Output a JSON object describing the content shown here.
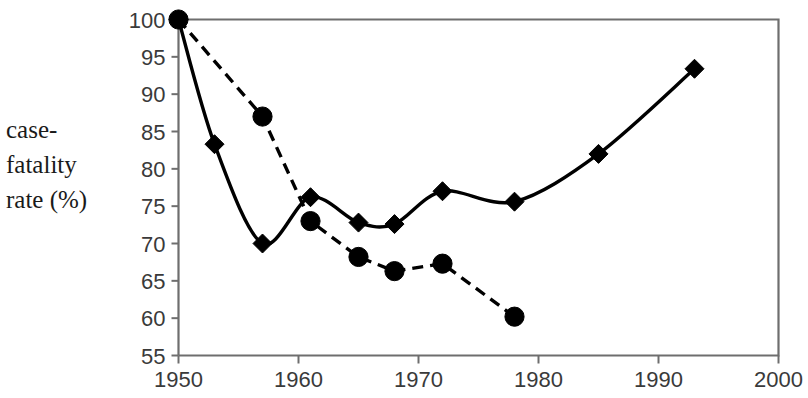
{
  "chart_data": {
    "type": "line",
    "title": "",
    "subtitle": "",
    "xlabel": "",
    "ylabel": "case-fatality rate (%)",
    "ylabel_lines": [
      "case-",
      "fatality",
      "rate (%)"
    ],
    "xlim": [
      1950,
      2000
    ],
    "ylim": [
      55,
      100
    ],
    "xticks": [
      1950,
      1960,
      1970,
      1980,
      1990,
      2000
    ],
    "xtick_labels": [
      "1950",
      "1960",
      "1970",
      "1980",
      "1990",
      "2000"
    ],
    "yticks": [
      55,
      60,
      65,
      70,
      75,
      80,
      85,
      90,
      95,
      100
    ],
    "ytick_labels": [
      "55",
      "60",
      "65",
      "70",
      "75",
      "80",
      "85",
      "90",
      "95",
      "100"
    ],
    "grid": false,
    "legend": "none",
    "colors": {
      "series": "#000000",
      "axis": "#6e6e6e",
      "text": "#3a3a3a",
      "background": "#ffffff"
    },
    "series": [
      {
        "name": "solid-diamond-series",
        "marker": "diamond",
        "linestyle": "solid",
        "color": "#000000",
        "x": [
          1950,
          1953,
          1957,
          1961,
          1965,
          1968,
          1972,
          1978,
          1985,
          1993
        ],
        "values": [
          100.0,
          83.3,
          70.0,
          76.2,
          72.8,
          72.6,
          77.0,
          75.6,
          82.0,
          93.4
        ]
      },
      {
        "name": "dashed-circle-series",
        "marker": "circle",
        "linestyle": "dashed",
        "color": "#000000",
        "x": [
          1950,
          1957,
          1961,
          1965,
          1968,
          1972,
          1978
        ],
        "values": [
          100.0,
          87.0,
          73.0,
          68.2,
          66.3,
          67.3,
          60.2
        ]
      }
    ]
  }
}
